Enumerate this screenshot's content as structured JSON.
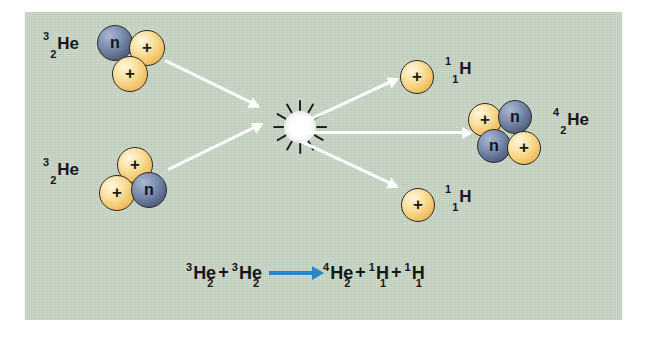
{
  "figure": {
    "panel_color": "#c5d2c2",
    "proton_color": "#f2c366",
    "neutron_color": "#556484",
    "arrow_color": "#ffffff",
    "equation_arrow_color": "#2b86c8"
  },
  "glyphs": {
    "proton": "+",
    "neutron": "n"
  },
  "reactants": [
    {
      "id": "he3-top",
      "mass_number": "3",
      "atomic_number": "2",
      "symbol": "He",
      "particles": [
        {
          "type": "neutron",
          "glyph": "n"
        },
        {
          "type": "proton",
          "glyph": "+"
        },
        {
          "type": "proton",
          "glyph": "+"
        }
      ]
    },
    {
      "id": "he3-bottom",
      "mass_number": "3",
      "atomic_number": "2",
      "symbol": "He",
      "particles": [
        {
          "type": "proton",
          "glyph": "+"
        },
        {
          "type": "proton",
          "glyph": "+"
        },
        {
          "type": "neutron",
          "glyph": "n"
        }
      ]
    }
  ],
  "products": [
    {
      "id": "h1-top",
      "mass_number": "1",
      "atomic_number": "1",
      "symbol": "H",
      "particles": [
        {
          "type": "proton",
          "glyph": "+"
        }
      ]
    },
    {
      "id": "he4",
      "mass_number": "4",
      "atomic_number": "2",
      "symbol": "He",
      "particles": [
        {
          "type": "proton",
          "glyph": "+"
        },
        {
          "type": "neutron",
          "glyph": "n"
        },
        {
          "type": "neutron",
          "glyph": "n"
        },
        {
          "type": "proton",
          "glyph": "+"
        }
      ]
    },
    {
      "id": "h1-bottom",
      "mass_number": "1",
      "atomic_number": "1",
      "symbol": "H",
      "particles": [
        {
          "type": "proton",
          "glyph": "+"
        }
      ]
    }
  ],
  "collision": {
    "label": "fusion-burst"
  },
  "equation": {
    "terms": [
      {
        "sup": "3",
        "sub": "2",
        "sym": "He"
      },
      {
        "op": "+"
      },
      {
        "sup": "3",
        "sub": "2",
        "sym": "He"
      },
      {
        "op": "arrow"
      },
      {
        "sup": "4",
        "sub": "2",
        "sym": "He"
      },
      {
        "op": "+"
      },
      {
        "sup": "1",
        "sub": "1",
        "sym": "H"
      },
      {
        "op": "+"
      },
      {
        "sup": "1",
        "sub": "1",
        "sym": "H"
      }
    ],
    "plus": "+"
  }
}
